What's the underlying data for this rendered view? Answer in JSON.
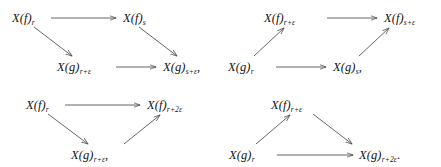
{
  "figure": {
    "background_color": "#ffffff",
    "ink_color": "#151515",
    "arrow_color": "#4a4a4a",
    "diagram_count": 4,
    "diagrams": [
      {
        "id": "diagram-1",
        "shape": "parallelogram",
        "nodes": [
          {
            "id": "d1-n1",
            "base": "X(f)",
            "sub": "r",
            "punct": ""
          },
          {
            "id": "d1-n2",
            "base": "X(f)",
            "sub": "s",
            "punct": ""
          },
          {
            "id": "d1-n3",
            "base": "X(g)",
            "sub": "r+ε",
            "punct": ""
          },
          {
            "id": "d1-n4",
            "base": "X(g)",
            "sub": "s+ε",
            "punct": ","
          }
        ],
        "arrows": [
          {
            "from": "d1-n1",
            "to": "d1-n2",
            "direction": "right"
          },
          {
            "from": "d1-n1",
            "to": "d1-n3",
            "direction": "down-right"
          },
          {
            "from": "d1-n2",
            "to": "d1-n4",
            "direction": "down-right"
          },
          {
            "from": "d1-n3",
            "to": "d1-n4",
            "direction": "right"
          }
        ]
      },
      {
        "id": "diagram-2",
        "shape": "parallelogram",
        "nodes": [
          {
            "id": "d2-n1",
            "base": "X(f)",
            "sub": "r+ε",
            "punct": ""
          },
          {
            "id": "d2-n2",
            "base": "X(f)",
            "sub": "s+ε",
            "punct": ""
          },
          {
            "id": "d2-n3",
            "base": "X(g)",
            "sub": "r",
            "punct": ""
          },
          {
            "id": "d2-n4",
            "base": "X(g)",
            "sub": "s",
            "punct": ","
          }
        ],
        "arrows": [
          {
            "from": "d2-n1",
            "to": "d2-n2",
            "direction": "right"
          },
          {
            "from": "d2-n3",
            "to": "d2-n1",
            "direction": "up-right"
          },
          {
            "from": "d2-n4",
            "to": "d2-n2",
            "direction": "up-right"
          },
          {
            "from": "d2-n3",
            "to": "d2-n4",
            "direction": "right"
          }
        ]
      },
      {
        "id": "diagram-3",
        "shape": "triangle-apex-down",
        "nodes": [
          {
            "id": "d3-n1",
            "base": "X(f)",
            "sub": "r",
            "punct": ""
          },
          {
            "id": "d3-n2",
            "base": "X(f)",
            "sub": "r+2ε",
            "punct": ""
          },
          {
            "id": "d3-n3",
            "base": "X(g)",
            "sub": "r+ε",
            "punct": ","
          }
        ],
        "arrows": [
          {
            "from": "d3-n1",
            "to": "d3-n2",
            "direction": "right"
          },
          {
            "from": "d3-n1",
            "to": "d3-n3",
            "direction": "down-right"
          },
          {
            "from": "d3-n3",
            "to": "d3-n2",
            "direction": "up-right"
          }
        ]
      },
      {
        "id": "diagram-4",
        "shape": "triangle-apex-up",
        "nodes": [
          {
            "id": "d4-n1",
            "base": "X(f)",
            "sub": "r+ε",
            "punct": ""
          },
          {
            "id": "d4-n2",
            "base": "X(g)",
            "sub": "r",
            "punct": ""
          },
          {
            "id": "d4-n3",
            "base": "X(g)",
            "sub": "r+2ε",
            "punct": "."
          }
        ],
        "arrows": [
          {
            "from": "d4-n2",
            "to": "d4-n1",
            "direction": "up-right"
          },
          {
            "from": "d4-n1",
            "to": "d4-n3",
            "direction": "down-right"
          },
          {
            "from": "d4-n2",
            "to": "d4-n3",
            "direction": "right"
          }
        ]
      }
    ]
  }
}
